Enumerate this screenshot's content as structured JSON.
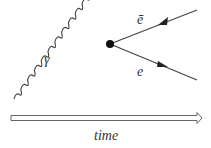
{
  "diagram": {
    "type": "feynman",
    "photon_label": "γ",
    "positron_label": "ē",
    "electron_label": "e",
    "time_label": "time",
    "colors": {
      "line": "#333333",
      "vertex": "#111111",
      "arrow_outline": "#555555"
    }
  }
}
